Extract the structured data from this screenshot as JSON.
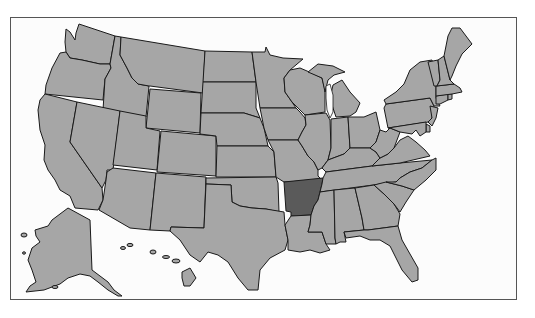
{
  "map": {
    "title": "",
    "type": "US states choropleth",
    "highlighted_state": "Arkansas",
    "colors": {
      "frame_border": "#555555",
      "background": "#fcfcfc",
      "default_fill": "#a6a6a6",
      "highlight_fill": "#5a5a5a",
      "state_border": "#1a1a1a"
    },
    "states": [
      {
        "id": "WA",
        "name": "Washington",
        "highlighted": false
      },
      {
        "id": "OR",
        "name": "Oregon",
        "highlighted": false
      },
      {
        "id": "CA",
        "name": "California",
        "highlighted": false
      },
      {
        "id": "ID",
        "name": "Idaho",
        "highlighted": false
      },
      {
        "id": "NV",
        "name": "Nevada",
        "highlighted": false
      },
      {
        "id": "MT",
        "name": "Montana",
        "highlighted": false
      },
      {
        "id": "WY",
        "name": "Wyoming",
        "highlighted": false
      },
      {
        "id": "UT",
        "name": "Utah",
        "highlighted": false
      },
      {
        "id": "AZ",
        "name": "Arizona",
        "highlighted": false
      },
      {
        "id": "CO",
        "name": "Colorado",
        "highlighted": false
      },
      {
        "id": "NM",
        "name": "New Mexico",
        "highlighted": false
      },
      {
        "id": "ND",
        "name": "North Dakota",
        "highlighted": false
      },
      {
        "id": "SD",
        "name": "South Dakota",
        "highlighted": false
      },
      {
        "id": "NE",
        "name": "Nebraska",
        "highlighted": false
      },
      {
        "id": "KS",
        "name": "Kansas",
        "highlighted": false
      },
      {
        "id": "OK",
        "name": "Oklahoma",
        "highlighted": false
      },
      {
        "id": "TX",
        "name": "Texas",
        "highlighted": false
      },
      {
        "id": "MN",
        "name": "Minnesota",
        "highlighted": false
      },
      {
        "id": "IA",
        "name": "Iowa",
        "highlighted": false
      },
      {
        "id": "MO",
        "name": "Missouri",
        "highlighted": false
      },
      {
        "id": "AR",
        "name": "Arkansas",
        "highlighted": true
      },
      {
        "id": "LA",
        "name": "Louisiana",
        "highlighted": false
      },
      {
        "id": "WI",
        "name": "Wisconsin",
        "highlighted": false
      },
      {
        "id": "IL",
        "name": "Illinois",
        "highlighted": false
      },
      {
        "id": "MI",
        "name": "Michigan",
        "highlighted": false
      },
      {
        "id": "IN",
        "name": "Indiana",
        "highlighted": false
      },
      {
        "id": "OH",
        "name": "Ohio",
        "highlighted": false
      },
      {
        "id": "KY",
        "name": "Kentucky",
        "highlighted": false
      },
      {
        "id": "TN",
        "name": "Tennessee",
        "highlighted": false
      },
      {
        "id": "MS",
        "name": "Mississippi",
        "highlighted": false
      },
      {
        "id": "AL",
        "name": "Alabama",
        "highlighted": false
      },
      {
        "id": "GA",
        "name": "Georgia",
        "highlighted": false
      },
      {
        "id": "FL",
        "name": "Florida",
        "highlighted": false
      },
      {
        "id": "SC",
        "name": "South Carolina",
        "highlighted": false
      },
      {
        "id": "NC",
        "name": "North Carolina",
        "highlighted": false
      },
      {
        "id": "VA",
        "name": "Virginia",
        "highlighted": false
      },
      {
        "id": "WV",
        "name": "West Virginia",
        "highlighted": false
      },
      {
        "id": "PA",
        "name": "Pennsylvania",
        "highlighted": false
      },
      {
        "id": "NY",
        "name": "New York",
        "highlighted": false
      },
      {
        "id": "NJ",
        "name": "New Jersey",
        "highlighted": false
      },
      {
        "id": "DE",
        "name": "Delaware",
        "highlighted": false
      },
      {
        "id": "MD",
        "name": "Maryland",
        "highlighted": false
      },
      {
        "id": "CT",
        "name": "Connecticut",
        "highlighted": false
      },
      {
        "id": "RI",
        "name": "Rhode Island",
        "highlighted": false
      },
      {
        "id": "MA",
        "name": "Massachusetts",
        "highlighted": false
      },
      {
        "id": "VT",
        "name": "Vermont",
        "highlighted": false
      },
      {
        "id": "NH",
        "name": "New Hampshire",
        "highlighted": false
      },
      {
        "id": "ME",
        "name": "Maine",
        "highlighted": false
      },
      {
        "id": "AK",
        "name": "Alaska",
        "highlighted": false
      },
      {
        "id": "HI",
        "name": "Hawaii",
        "highlighted": false
      }
    ]
  }
}
